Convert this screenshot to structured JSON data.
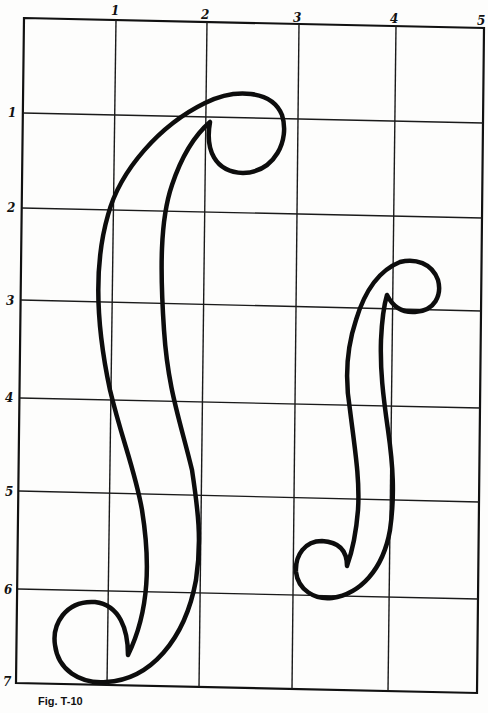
{
  "figure": {
    "caption": "Fig. T-10",
    "grid": {
      "columns": 5,
      "rows": 7,
      "column_labels": [
        "1",
        "2",
        "3",
        "4",
        "5"
      ],
      "row_labels": [
        "1",
        "2",
        "3",
        "4",
        "5",
        "6",
        "7"
      ]
    },
    "shapes": [
      {
        "name": "large-s-scroll",
        "description": "large f-hole / S-shaped scroll spanning rows 1-7, columns 0-3"
      },
      {
        "name": "small-s-scroll",
        "description": "small f-hole / S-shaped scroll spanning rows 2.5-6, columns 3-4.5"
      }
    ],
    "colors": {
      "line": "#111111",
      "background": "#fdfdfc"
    }
  }
}
